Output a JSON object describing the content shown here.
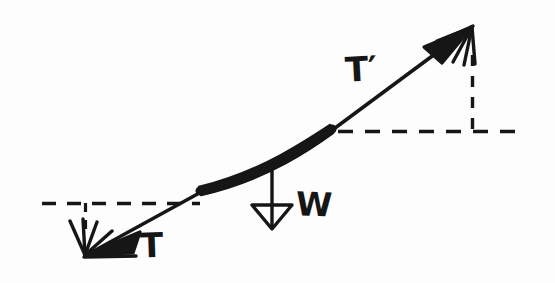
{
  "figure": {
    "background_color": "#fdfdfd",
    "ink_color": "#161616",
    "width": 555,
    "height": 283
  },
  "labels": {
    "tension_left": "T",
    "tension_right": "T′",
    "weight": "W"
  },
  "vectors": [
    {
      "name": "tension-left",
      "label": "T",
      "from": [
        200,
        192
      ],
      "to": [
        85,
        255
      ],
      "arrowhead": "fan-filled",
      "direction": "down-left"
    },
    {
      "name": "tension-right",
      "label": "T′",
      "from": [
        332,
        132
      ],
      "to": [
        472,
        27
      ],
      "arrowhead": "fan-filled",
      "direction": "up-right"
    },
    {
      "name": "weight",
      "label": "W",
      "from": [
        272,
        172
      ],
      "to": [
        272,
        228
      ],
      "arrowhead": "hollow-triangle",
      "direction": "down"
    }
  ],
  "cable": {
    "name": "cable-segment",
    "description": "thick solid curved band",
    "start": [
      200,
      192
    ],
    "end": [
      332,
      132
    ]
  },
  "guides": [
    {
      "name": "horizontal-dashed-left",
      "orientation": "horizontal",
      "from": [
        42,
        203
      ],
      "to": [
        200,
        203
      ]
    },
    {
      "name": "vertical-dashed-left",
      "orientation": "vertical",
      "from": [
        85,
        203
      ],
      "to": [
        85,
        231
      ]
    },
    {
      "name": "horizontal-dashed-right",
      "orientation": "horizontal",
      "from": [
        338,
        131
      ],
      "to": [
        521,
        131
      ]
    },
    {
      "name": "vertical-dashed-right",
      "orientation": "vertical",
      "from": [
        472,
        55
      ],
      "to": [
        472,
        131
      ]
    }
  ]
}
